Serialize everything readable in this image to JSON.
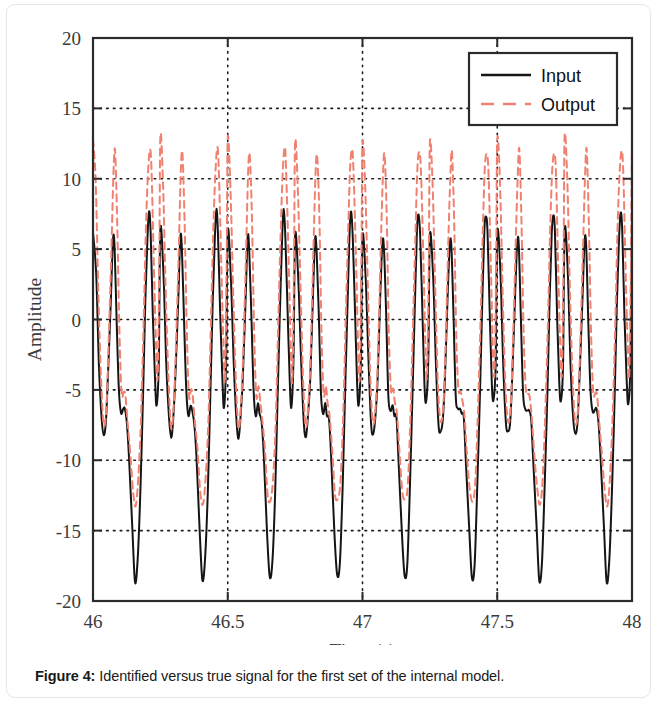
{
  "figure": {
    "caption_label": "Figure 4:",
    "caption_text": " Identified versus true signal for the first set of the internal model."
  },
  "chart_data": {
    "type": "line",
    "title": "",
    "xlabel": "Time (s)",
    "ylabel": "Amplitude",
    "xlim": [
      46,
      48
    ],
    "ylim": [
      -20,
      20
    ],
    "xticks": [
      46,
      46.5,
      47,
      47.5,
      48
    ],
    "xtick_labels": [
      "46",
      "46.5",
      "47",
      "47.5",
      "48"
    ],
    "yticks": [
      -20,
      -15,
      -10,
      -5,
      0,
      5,
      10,
      15,
      20
    ],
    "ytick_labels": [
      "-20",
      "-15",
      "-10",
      "-5",
      "0",
      "5",
      "10",
      "15",
      "20"
    ],
    "grid": true,
    "grid_style": "dotted",
    "legend_position": "upper right",
    "period_seconds": 0.25,
    "cycles_visible": 8,
    "series": [
      {
        "name": "Input",
        "color": "#151515",
        "style": "solid",
        "width": 2.0,
        "description": "True signal: per 0.25 s cycle two sharp positive spikes near +5 to +8, a small shoulder near -6, then a deep narrow trough near -18.5",
        "cycle_points": [
          [
            0.0,
            6.2
          ],
          [
            0.012,
            3.0
          ],
          [
            0.022,
            -3.0
          ],
          [
            0.032,
            -7.2
          ],
          [
            0.04,
            -8.2
          ],
          [
            0.048,
            -7.0
          ],
          [
            0.056,
            -4.0
          ],
          [
            0.066,
            1.5
          ],
          [
            0.074,
            5.6
          ],
          [
            0.08,
            5.0
          ],
          [
            0.088,
            0.0
          ],
          [
            0.096,
            -5.2
          ],
          [
            0.104,
            -6.6
          ],
          [
            0.112,
            -6.2
          ],
          [
            0.118,
            -6.6
          ],
          [
            0.126,
            -7.2
          ],
          [
            0.134,
            -10.0
          ],
          [
            0.146,
            -15.0
          ],
          [
            0.156,
            -18.4
          ],
          [
            0.166,
            -17.2
          ],
          [
            0.176,
            -12.0
          ],
          [
            0.186,
            -5.0
          ],
          [
            0.194,
            1.0
          ],
          [
            0.202,
            6.0
          ],
          [
            0.208,
            7.6
          ],
          [
            0.214,
            6.0
          ],
          [
            0.222,
            0.5
          ],
          [
            0.23,
            -4.4
          ],
          [
            0.236,
            -6.0
          ],
          [
            0.244,
            -3.0
          ],
          [
            0.25,
            6.2
          ]
        ]
      },
      {
        "name": "Output",
        "color": "#F08070",
        "style": "dashed",
        "width": 2.0,
        "dash_pattern": [
          7,
          5
        ],
        "description": "Identified signal: follows the input shape but overshoots, peaks near +10 to +13 and troughs near -13",
        "cycle_points": [
          [
            0.0,
            12.8
          ],
          [
            0.01,
            9.6
          ],
          [
            0.02,
            2.0
          ],
          [
            0.03,
            -4.5
          ],
          [
            0.04,
            -7.5
          ],
          [
            0.05,
            -6.0
          ],
          [
            0.058,
            -2.0
          ],
          [
            0.068,
            5.0
          ],
          [
            0.076,
            10.4
          ],
          [
            0.082,
            11.8
          ],
          [
            0.09,
            7.0
          ],
          [
            0.098,
            -1.0
          ],
          [
            0.106,
            -5.2
          ],
          [
            0.114,
            -5.0
          ],
          [
            0.12,
            -5.6
          ],
          [
            0.128,
            -7.0
          ],
          [
            0.138,
            -9.5
          ],
          [
            0.148,
            -12.2
          ],
          [
            0.158,
            -13.0
          ],
          [
            0.168,
            -11.5
          ],
          [
            0.178,
            -7.0
          ],
          [
            0.188,
            0.0
          ],
          [
            0.196,
            6.0
          ],
          [
            0.204,
            10.6
          ],
          [
            0.212,
            12.0
          ],
          [
            0.218,
            10.0
          ],
          [
            0.226,
            4.0
          ],
          [
            0.234,
            -2.0
          ],
          [
            0.24,
            -4.0
          ],
          [
            0.246,
            4.0
          ],
          [
            0.25,
            12.8
          ]
        ]
      }
    ],
    "legend": [
      {
        "label": "Input",
        "color": "#151515",
        "style": "solid"
      },
      {
        "label": "Output",
        "color": "#F08070",
        "style": "dashed"
      }
    ]
  }
}
